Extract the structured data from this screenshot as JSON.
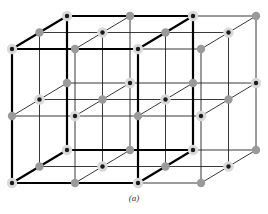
{
  "figure": {
    "caption": "(a)",
    "lattice_size": {
      "x": 4,
      "y": 3,
      "z": 3
    },
    "unit_cell": {
      "x": [
        0,
        2
      ],
      "y": [
        0,
        2
      ],
      "z": [
        0,
        2
      ]
    },
    "species": [
      {
        "name": "ion-a",
        "style": "dark-core-with-halo",
        "core_color": "#1a1a1a",
        "halo_color": "#d9d9d9"
      },
      {
        "name": "ion-b",
        "style": "plain-gray",
        "color": "#9a9a9a"
      }
    ],
    "colors": {
      "line": "#222222",
      "bold_line": "#000000",
      "background": "#ffffff"
    }
  }
}
